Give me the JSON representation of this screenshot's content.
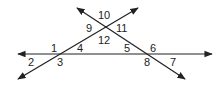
{
  "diagram": {
    "type": "geometry-angles",
    "colors": {
      "line": "#222222",
      "text": "#222222",
      "background": "#ffffff"
    },
    "lines": [
      {
        "name": "horizontal-line",
        "x1": 18,
        "y1": 54,
        "x2": 212,
        "y2": 54
      },
      {
        "name": "transversal-rising",
        "x1": 18,
        "y1": 79,
        "x2": 138,
        "y2": 8
      },
      {
        "name": "transversal-falling",
        "x1": 77,
        "y1": 8,
        "x2": 185,
        "y2": 79
      }
    ],
    "angle_labels": [
      {
        "id": "1",
        "text": "1",
        "x": 51,
        "y": 52
      },
      {
        "id": "2",
        "text": "2",
        "x": 28,
        "y": 66
      },
      {
        "id": "3",
        "text": "3",
        "x": 57,
        "y": 66
      },
      {
        "id": "4",
        "text": "4",
        "x": 77,
        "y": 52
      },
      {
        "id": "5",
        "text": "5",
        "x": 124,
        "y": 52
      },
      {
        "id": "6",
        "text": "6",
        "x": 150,
        "y": 52
      },
      {
        "id": "7",
        "text": "7",
        "x": 170,
        "y": 66
      },
      {
        "id": "8",
        "text": "8",
        "x": 144,
        "y": 66
      },
      {
        "id": "9",
        "text": "9",
        "x": 86,
        "y": 32
      },
      {
        "id": "10",
        "text": "10",
        "x": 98,
        "y": 19
      },
      {
        "id": "11",
        "text": "11",
        "x": 116,
        "y": 32
      },
      {
        "id": "12",
        "text": "12",
        "x": 98,
        "y": 44
      }
    ]
  }
}
